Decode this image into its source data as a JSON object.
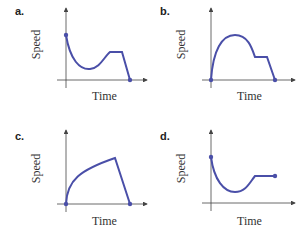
{
  "panels": [
    {
      "label": "a.",
      "xlabel": "Time",
      "ylabel": "Speed",
      "description": "starts high, dips to a minimum, rises to a constant plateau, then drops to zero"
    },
    {
      "label": "b.",
      "xlabel": "Time",
      "ylabel": "Speed",
      "description": "starts at zero, rises to a peak, decreases to a constant plateau, then drops to zero"
    },
    {
      "label": "c.",
      "xlabel": "Time",
      "ylabel": "Speed",
      "description": "starts at zero, increases concavely to a maximum, then drops linearly to zero"
    },
    {
      "label": "d.",
      "xlabel": "Time",
      "ylabel": "Speed",
      "description": "starts high, dips to a minimum, rises to a constant plateau that continues"
    }
  ],
  "colors": {
    "curve": "#4a4fa8",
    "axis": "#444444"
  }
}
